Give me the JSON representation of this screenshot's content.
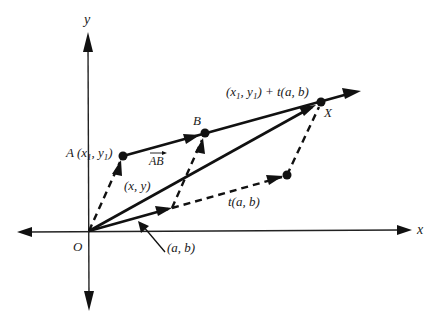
{
  "diagram": {
    "axes": {
      "x_label": "x",
      "y_label": "y",
      "origin_label": "O"
    },
    "points": {
      "A": {
        "label": "A",
        "coords_label": "(x",
        "sub1": "1",
        "comma": ", y",
        "sub2": "1",
        "close": ")"
      },
      "B": {
        "label": "B"
      },
      "X": {
        "label": "X"
      }
    },
    "labels": {
      "AB_vector": "AB",
      "xy": "(x, y)",
      "ab": "(a, b)",
      "tab": "t(a, b)",
      "line_eq_prefix": "(x",
      "line_eq_sub1": "1",
      "line_eq_mid": ", y",
      "line_eq_sub2": "1",
      "line_eq_suffix": ") + t(a, b)"
    },
    "colors": {
      "stroke": "#111111",
      "background": "#ffffff"
    }
  }
}
